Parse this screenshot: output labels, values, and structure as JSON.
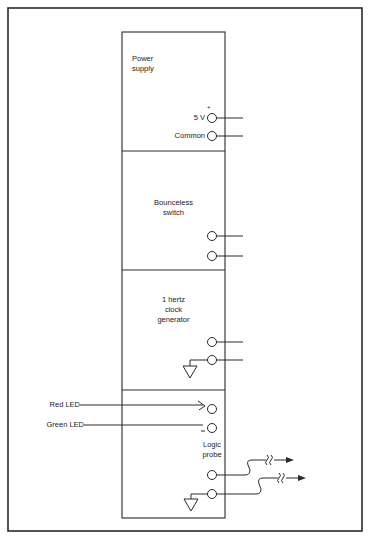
{
  "diagram": {
    "modules": [
      {
        "id": "power-supply",
        "title_lines": [
          "Power",
          "supply"
        ],
        "terminals": [
          {
            "label": "5 V",
            "polarity": "+"
          },
          {
            "label": "Common"
          }
        ]
      },
      {
        "id": "bounceless-switch",
        "title_lines": [
          "Bounceless",
          "switch"
        ],
        "terminals": [
          {
            "label": ""
          },
          {
            "label": ""
          }
        ]
      },
      {
        "id": "clock-generator",
        "title_lines": [
          "1 hertz",
          "clock",
          "generator"
        ],
        "terminals": [
          {
            "label": ""
          },
          {
            "label": "",
            "ground": true
          }
        ]
      },
      {
        "id": "logic-probe",
        "title_lines": [
          "Logic",
          "probe"
        ],
        "inputs": [
          {
            "label": "Red LED"
          },
          {
            "label": "Green LED"
          }
        ],
        "terminals": [
          {
            "label": ""
          },
          {
            "label": "",
            "ground": true
          }
        ]
      }
    ],
    "colors": {
      "line": "#2a2a2a",
      "background": "#ffffff"
    }
  }
}
